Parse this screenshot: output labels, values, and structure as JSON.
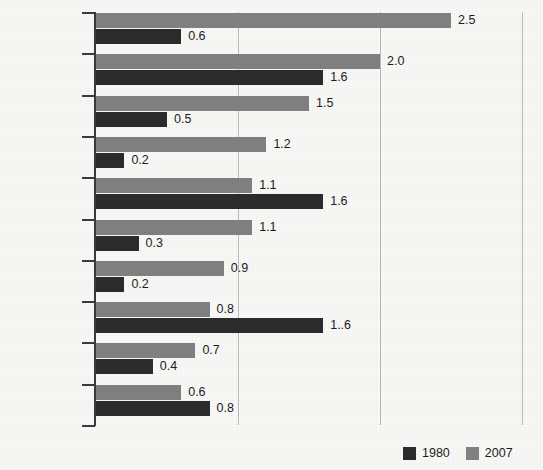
{
  "chart_data": {
    "type": "bar",
    "orientation": "horizontal",
    "title": "",
    "subtitle": "",
    "xlabel": "",
    "ylabel": "",
    "xlim": [
      0,
      3.15
    ],
    "gridlines": [
      1.0,
      2.0,
      3.0
    ],
    "grid": true,
    "legend_position": "bottom-right",
    "categories": [
      "Chinese",
      "French",
      "Tagalog",
      "Vietnamese",
      "German",
      "Korean",
      "Russian",
      "Italian",
      "Portuguese",
      "Polish"
    ],
    "series": [
      {
        "name": "1980",
        "color": "#2b2b2b",
        "values": [
          0.6,
          1.6,
          0.5,
          0.2,
          1.6,
          0.3,
          0.2,
          1.6,
          0.4,
          0.8
        ],
        "labels": [
          "0.6",
          "1.6",
          "0.5",
          "0.2",
          "1.6",
          "0.3",
          "0.2",
          "1..6",
          "0.4",
          "0.8"
        ]
      },
      {
        "name": "2007",
        "color": "#808080",
        "values": [
          2.5,
          2.0,
          1.5,
          1.2,
          1.1,
          1.1,
          0.9,
          0.8,
          0.7,
          0.6
        ],
        "labels": [
          "2.5",
          "2.0",
          "1.5",
          "1.2",
          "1.1",
          "1.1",
          "0.9",
          "0.8",
          "0.7",
          "0.6"
        ]
      }
    ]
  },
  "legend": {
    "items": [
      {
        "label": "1980",
        "swatch": "dark"
      },
      {
        "label": "2007",
        "swatch": "gray"
      }
    ]
  }
}
